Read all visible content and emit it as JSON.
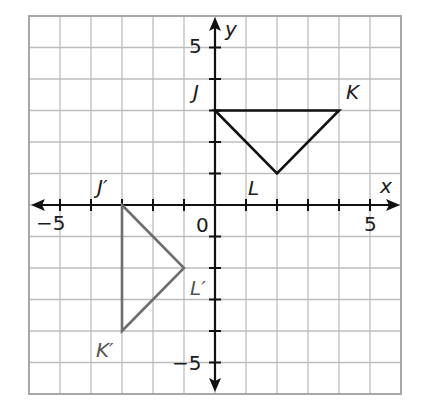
{
  "figure": {
    "type": "coordinate-plane",
    "x_axis_label": "x",
    "y_axis_label": "y",
    "x_range": [
      -6,
      6
    ],
    "y_range": [
      -6,
      6
    ],
    "tick_labels": {
      "x_neg5": "−5",
      "x_pos5": "5",
      "y_pos5": "5",
      "y_neg5": "−5",
      "origin": "0"
    },
    "colors": {
      "grid": "#bdbdbd",
      "border": "#a8a8a8",
      "axes": "#111111",
      "preimage": "#111111",
      "image": "#6e6e6e"
    }
  },
  "triangles": {
    "preimage": {
      "name": "JKL",
      "vertices": [
        {
          "label": "J",
          "x": 0,
          "y": 3
        },
        {
          "label": "K",
          "x": 4,
          "y": 3
        },
        {
          "label": "L",
          "x": 2,
          "y": 1
        }
      ]
    },
    "image": {
      "name": "J'K'L'",
      "vertices": [
        {
          "label": "J′",
          "x": -3,
          "y": 0
        },
        {
          "label": "K′",
          "x": -3,
          "y": -4
        },
        {
          "label": "L′",
          "x": -1,
          "y": -2
        }
      ]
    }
  },
  "chart_data": {
    "type": "scatter",
    "title": "",
    "xlabel": "x",
    "ylabel": "y",
    "xlim": [
      -6,
      6
    ],
    "ylim": [
      -6,
      6
    ],
    "grid": true,
    "x_ticks_labeled": [
      -5,
      0,
      5
    ],
    "y_ticks_labeled": [
      -5,
      5
    ],
    "series": [
      {
        "name": "Triangle JKL",
        "points": [
          [
            0,
            3
          ],
          [
            4,
            3
          ],
          [
            2,
            1
          ]
        ],
        "labels": [
          "J",
          "K",
          "L"
        ],
        "closed": true,
        "color": "#111111"
      },
      {
        "name": "Triangle J'K'L'",
        "points": [
          [
            -3,
            0
          ],
          [
            -3,
            -4
          ],
          [
            -1,
            -2
          ]
        ],
        "labels": [
          "J′",
          "K′",
          "L′"
        ],
        "closed": true,
        "color": "#6e6e6e"
      }
    ]
  }
}
